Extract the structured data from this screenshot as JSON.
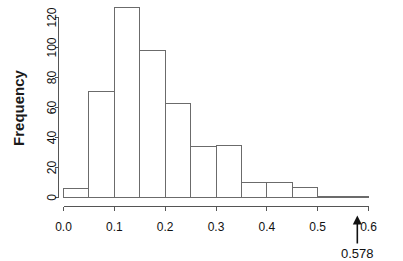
{
  "chart_data": {
    "type": "bar",
    "subtype": "histogram",
    "title": "",
    "xlabel": "",
    "ylabel": "Frequency",
    "bin_width": 0.05,
    "bin_edges": [
      0.0,
      0.05,
      0.1,
      0.15,
      0.2,
      0.25,
      0.3,
      0.35,
      0.4,
      0.45,
      0.5,
      0.55,
      0.6
    ],
    "categories": [
      "0.00-0.05",
      "0.05-0.10",
      "0.10-0.15",
      "0.15-0.20",
      "0.20-0.25",
      "0.25-0.30",
      "0.30-0.35",
      "0.35-0.40",
      "0.40-0.45",
      "0.45-0.50",
      "0.50-0.55",
      "0.55-0.60"
    ],
    "values": [
      6,
      71,
      127,
      98,
      63,
      34,
      35,
      10,
      10,
      7,
      1,
      1
    ],
    "xlim": [
      0.0,
      0.6
    ],
    "ylim": [
      0,
      127
    ],
    "xticks": [
      0.0,
      0.1,
      0.2,
      0.3,
      0.4,
      0.5,
      0.6
    ],
    "xtick_labels": [
      "0.0",
      "0.1",
      "0.2",
      "0.3",
      "0.4",
      "0.5",
      "0.6"
    ],
    "yticks": [
      0,
      20,
      40,
      60,
      80,
      100,
      120
    ],
    "ytick_labels": [
      "0",
      "20",
      "40",
      "60",
      "80",
      "100",
      "120"
    ],
    "grid": false,
    "legend": false,
    "annotations": [
      {
        "name": "observed-value-arrow",
        "label": "0.578",
        "x": 0.578,
        "type": "up-arrow",
        "color": "#111111"
      }
    ],
    "colors": {
      "bar_fill": "#ffffff",
      "bar_stroke": "#6b6b6b",
      "axis": "#555555",
      "text": "#111111",
      "background": "#ffffff"
    }
  }
}
